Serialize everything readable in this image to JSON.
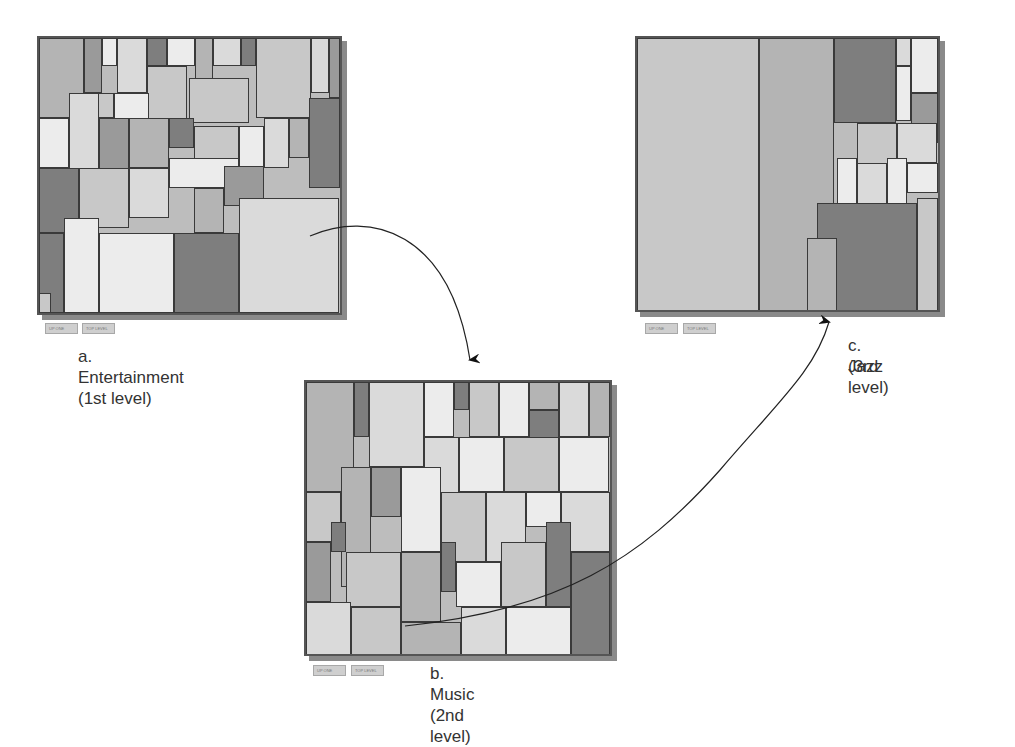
{
  "figure": {
    "panels": [
      {
        "id": "entertainment",
        "caption": "a. Entertainment (1st level)",
        "level": 1,
        "buttons": [
          "UP ONE",
          "TOP LEVEL"
        ]
      },
      {
        "id": "music",
        "caption": "b. Music (2nd level)",
        "level": 2,
        "buttons": [
          "UP ONE",
          "TOP LEVEL"
        ]
      },
      {
        "id": "jazz",
        "caption_line1": "c. Jazz",
        "caption_line2": "(3rd level)",
        "level": 3,
        "buttons": [
          "UP ONE",
          "TOP LEVEL"
        ]
      }
    ],
    "shades": [
      "#9a9a9a",
      "#b4b4b4",
      "#c8c8c8",
      "#dadada",
      "#ececec",
      "#7e7e7e"
    ]
  }
}
